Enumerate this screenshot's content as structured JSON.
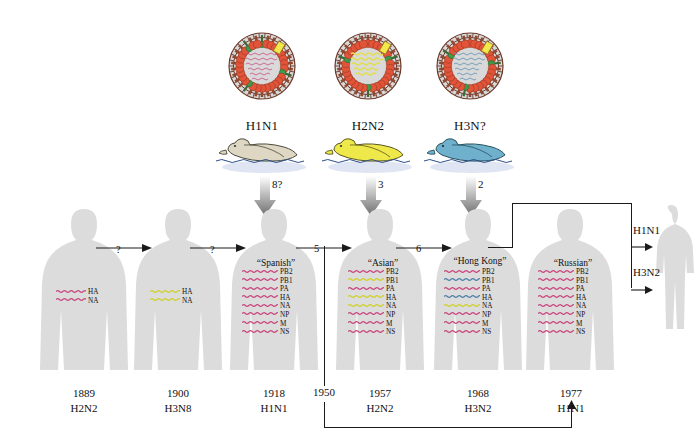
{
  "figure": {
    "background": "#ffffff"
  },
  "palette": {
    "human_gene_pink": "#c9477f",
    "human_gene_yellow": "#cfd12a",
    "human_gene_blue": "#4f7fa8",
    "ha_spike": "#e2543a",
    "na_spike": "#3f9a4a",
    "envelope": "#6d3a2a",
    "capsid": "#d8d8d8",
    "duck_h1n1": "#ded7c4",
    "duck_h2n2": "#efe84a",
    "duck_h3n": "#6fb0cc",
    "water": "#b9c6e4",
    "silhouette": "#dcdcdc",
    "line": "#1a1a1a"
  },
  "avian_reservoir": [
    {
      "id": "avian-h1n1",
      "subtype": "H1N1",
      "duck_color": "duck_h1n1",
      "rna_color": "human_gene_pink"
    },
    {
      "id": "avian-h2n2",
      "subtype": "H2N2",
      "duck_color": "duck_h2n2",
      "rna_color": "human_gene_yellow"
    },
    {
      "id": "avian-h3n",
      "subtype": "H3N?",
      "duck_color": "duck_h3n",
      "rna_color": "human_gene_blue"
    }
  ],
  "gene_names": [
    "PB2",
    "PB1",
    "PA",
    "HA",
    "NA",
    "NP",
    "M",
    "NS"
  ],
  "transfer_arrows": [
    {
      "label": "8?",
      "target": "1918"
    },
    {
      "label": "3",
      "target": "1957"
    },
    {
      "label": "2",
      "target": "1968"
    }
  ],
  "human_strains": [
    {
      "id": "1889",
      "year": "1889",
      "subtype": "H2N2",
      "strain_name": "",
      "genes_shown": [
        "HA",
        "NA"
      ],
      "gene_colors": [
        "pink",
        "pink"
      ]
    },
    {
      "id": "1900",
      "year": "1900",
      "subtype": "H3N8",
      "strain_name": "",
      "genes_shown": [
        "HA",
        "NA"
      ],
      "gene_colors": [
        "yellow",
        "yellow"
      ]
    },
    {
      "id": "1918",
      "year": "1918",
      "subtype": "H1N1",
      "strain_name": "“Spanish”",
      "genes_shown": [
        "PB2",
        "PB1",
        "PA",
        "HA",
        "NA",
        "NP",
        "M",
        "NS"
      ],
      "gene_colors": [
        "pink",
        "pink",
        "pink",
        "pink",
        "pink",
        "pink",
        "pink",
        "pink"
      ]
    },
    {
      "id": "1957",
      "year": "1957",
      "subtype": "H2N2",
      "strain_name": "“Asian”",
      "genes_shown": [
        "PB2",
        "PB1",
        "PA",
        "HA",
        "NA",
        "NP",
        "M",
        "NS"
      ],
      "gene_colors": [
        "pink",
        "yellow",
        "pink",
        "yellow",
        "yellow",
        "pink",
        "pink",
        "pink"
      ]
    },
    {
      "id": "1968",
      "year": "1968",
      "subtype": "H3N2",
      "strain_name": "“Hong Kong”",
      "genes_shown": [
        "PB2",
        "PB1",
        "PA",
        "HA",
        "NA",
        "NP",
        "M",
        "NS"
      ],
      "gene_colors": [
        "pink",
        "blue",
        "pink",
        "blue",
        "yellow",
        "pink",
        "pink",
        "pink"
      ]
    },
    {
      "id": "1977",
      "year": "1977",
      "subtype": "H1N1",
      "strain_name": "“Russian”",
      "genes_shown": [
        "PB2",
        "PB1",
        "PA",
        "HA",
        "NA",
        "NP",
        "M",
        "NS"
      ],
      "gene_colors": [
        "pink",
        "pink",
        "pink",
        "pink",
        "pink",
        "pink",
        "pink",
        "pink"
      ]
    }
  ],
  "timeline_marker": {
    "year": "1950"
  },
  "lineage_arrows": [
    {
      "id": "a1",
      "label": "?"
    },
    {
      "id": "a2",
      "label": "?"
    },
    {
      "id": "a3",
      "label": "5"
    },
    {
      "id": "a4",
      "label": "6"
    }
  ],
  "cocirculation": {
    "top_label": "H1N1",
    "bottom_label": "H3N2"
  }
}
